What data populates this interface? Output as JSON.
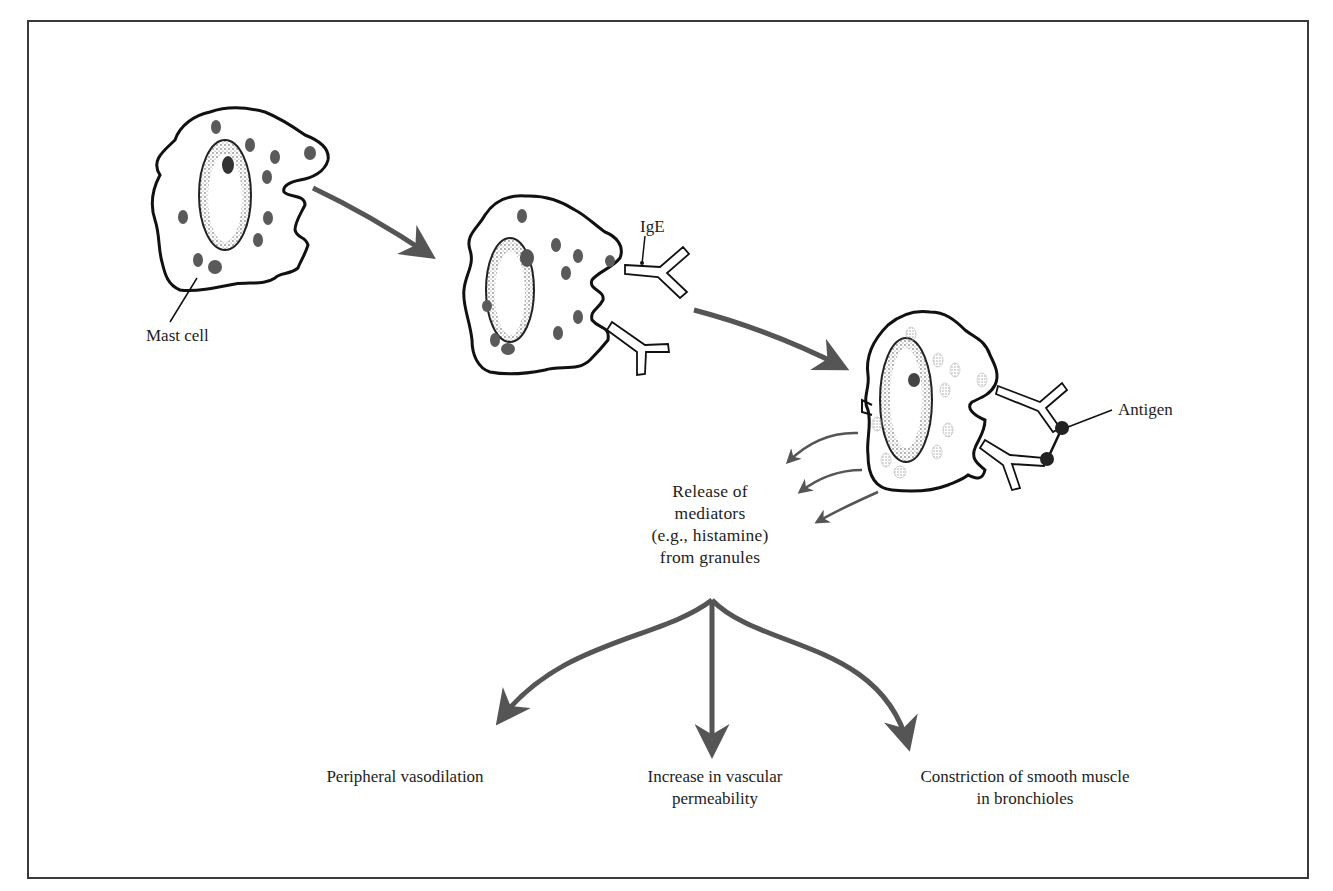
{
  "diagram": {
    "type": "biological process flow",
    "colors": {
      "frame": "#3a3a3a",
      "cell_outline": "#111111",
      "granule_dark": "#5a5a5a",
      "granule_released": "#b5b5b5",
      "arrow": "#555555",
      "nucleus_stipple": "#6a6a6a"
    },
    "stages": [
      {
        "id": "mast-cell",
        "label": "Mast cell"
      },
      {
        "id": "ige-bound",
        "label": "IgE"
      },
      {
        "id": "antigen-crosslink",
        "label": "Antigen"
      }
    ],
    "release": {
      "lines": [
        "Release of",
        "mediators",
        "(e.g., histamine)",
        "from granules"
      ]
    },
    "effects": [
      {
        "id": "vasodilation",
        "lines": [
          "Peripheral vasodilation"
        ]
      },
      {
        "id": "permeability",
        "lines": [
          "Increase in vascular",
          "permeability"
        ]
      },
      {
        "id": "bronchoconstriction",
        "lines": [
          "Constriction of smooth muscle",
          "in bronchioles"
        ]
      }
    ]
  }
}
